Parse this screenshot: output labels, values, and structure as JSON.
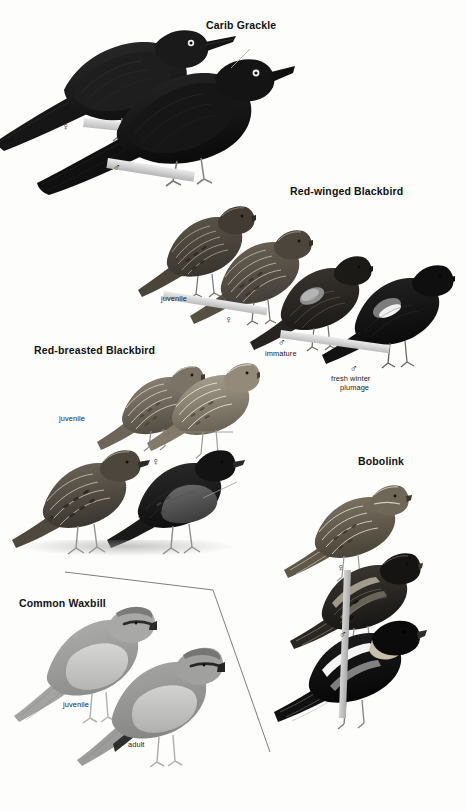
{
  "page": {
    "kind": "field-guide-plate",
    "width": 467,
    "height": 811,
    "background_color": "#fdfdfc"
  },
  "symbols": {
    "male": "♂",
    "female": "♀"
  },
  "species": [
    {
      "id": "carib-grackle",
      "title": "Carib Grackle",
      "title_pos": {
        "x": 206,
        "y": 19
      },
      "figures": [
        {
          "id": "carib-grackle-female",
          "label": "♀",
          "kind": "symbol",
          "x": 62,
          "y": 121
        },
        {
          "id": "carib-grackle-male",
          "label": "♂",
          "kind": "symbol",
          "x": 113,
          "y": 162
        }
      ]
    },
    {
      "id": "red-winged-blackbird",
      "title": "Red-winged Blackbird",
      "title_pos": {
        "x": 290,
        "y": 185
      },
      "figures": [
        {
          "id": "rwbl-juvenile",
          "label": "juvenile",
          "kind": "text",
          "x": 161,
          "y": 294
        },
        {
          "id": "rwbl-female",
          "label": "♀",
          "kind": "symbol",
          "x": 225,
          "y": 314
        },
        {
          "id": "rwbl-immature-sym",
          "label": "♂",
          "kind": "symbol",
          "x": 278,
          "y": 337
        },
        {
          "id": "rwbl-immature",
          "label": "immature",
          "kind": "text",
          "x": 265,
          "y": 349
        },
        {
          "id": "rwbl-male-sym",
          "label": "♂",
          "kind": "symbol",
          "x": 350,
          "y": 363
        },
        {
          "id": "rwbl-male-line1",
          "label": "fresh winter",
          "kind": "text",
          "x": 331,
          "y": 374
        },
        {
          "id": "rwbl-male-line2",
          "label": "plumage",
          "kind": "text",
          "x": 340,
          "y": 383
        }
      ]
    },
    {
      "id": "red-breasted-blackbird",
      "title": "Red-breasted Blackbird",
      "title_pos": {
        "x": 34,
        "y": 344
      },
      "figures": [
        {
          "id": "rbbl-juvenile",
          "label": "juvenile",
          "kind": "text",
          "x": 59,
          "y": 414
        },
        {
          "id": "rbbl-female",
          "label": "♀",
          "kind": "symbol",
          "x": 152,
          "y": 456
        },
        {
          "id": "rbbl-male-1",
          "label": "♂",
          "kind": "symbol",
          "x": 47,
          "y": 513
        },
        {
          "id": "rbbl-male-2",
          "label": "♂",
          "kind": "symbol",
          "x": 137,
          "y": 511
        }
      ]
    },
    {
      "id": "bobolink",
      "title": "Bobolink",
      "title_pos": {
        "x": 358,
        "y": 455
      },
      "figures": [
        {
          "id": "bobolink-female",
          "label": "♀",
          "kind": "symbol",
          "x": 337,
          "y": 562
        },
        {
          "id": "bobolink-male-1",
          "label": "♂",
          "kind": "symbol",
          "x": 339,
          "y": 629
        },
        {
          "id": "bobolink-male-2",
          "label": "♂",
          "kind": "symbol",
          "x": 328,
          "y": 694
        }
      ]
    },
    {
      "id": "common-waxbill",
      "title": "Common Waxbill",
      "title_pos": {
        "x": 19,
        "y": 597
      },
      "figures": [
        {
          "id": "waxbill-juvenile",
          "label": "juvenile",
          "kind": "text",
          "x": 63,
          "y": 700
        },
        {
          "id": "waxbill-adult",
          "label": "adult",
          "kind": "text",
          "x": 128,
          "y": 740
        }
      ]
    }
  ],
  "divider": {
    "id": "waxbill-panel-divider",
    "description": "angled separator line enclosing the Common Waxbill panel",
    "color": "#6f6f6f",
    "points": "65,572 213,590 270,752"
  },
  "leader_lines": [
    {
      "id": "carib-grackle-leader",
      "x1": 250,
      "y1": 49,
      "x2": 231,
      "y2": 68,
      "color": "#a8a8a8"
    },
    {
      "id": "red-breasted-female-leader",
      "x1": 233,
      "y1": 432,
      "x2": 180,
      "y2": 432,
      "color": "#8e8e8e"
    },
    {
      "id": "red-breasted-male-leader",
      "x1": 236,
      "y1": 483,
      "x2": 205,
      "y2": 497,
      "color": "#9a9a9a"
    }
  ],
  "palette": {
    "plumage_black": "#1b1b1b",
    "plumage_dark": "#2e2e2e",
    "plumage_mid": "#585858",
    "plumage_brown": "#6b6257",
    "plumage_light": "#b9b2a6",
    "plumage_pale": "#d8d3c8",
    "epaulet": "#8a8a8a",
    "epaulet_highlight": "#efefef",
    "perch_gray": "#cfcfcf",
    "ground_gray": "#c9c9c9",
    "leg_gray": "#8c8c8c",
    "eye_ring": "#f2f2f2"
  }
}
